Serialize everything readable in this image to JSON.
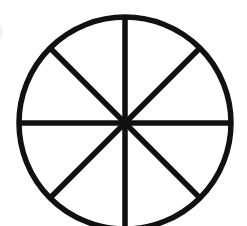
{
  "diagram": {
    "type": "divided-circle",
    "sectors": 8,
    "center": {
      "x": 125,
      "y": 123
    },
    "radius": 106,
    "stroke_width": 5.5,
    "colors": {
      "stroke": "#111111",
      "background": "#ffffff",
      "fill": "none"
    },
    "spoke_angles_deg": [
      0,
      45,
      90,
      135
    ]
  }
}
